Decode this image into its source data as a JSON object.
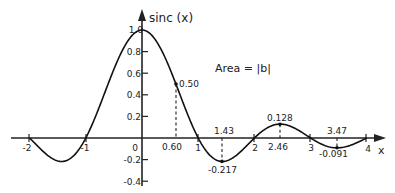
{
  "chart_data": {
    "type": "line",
    "title": "",
    "xlabel": "x",
    "ylabel": "sinc (x)",
    "xlim": [
      -2,
      4
    ],
    "ylim": [
      -0.4,
      1.0
    ],
    "grid": false,
    "legend": null,
    "function": "sinc(x) = sin(pi x)/(pi x)",
    "x_ticks": [
      -2,
      -1,
      0,
      1,
      2,
      3,
      4
    ],
    "x_tick_labels": [
      "-2",
      "-1",
      "0",
      "1",
      "2",
      "3",
      "4"
    ],
    "y_ticks": [
      -0.4,
      -0.2,
      0.2,
      0.4,
      0.6,
      0.8,
      1.0
    ],
    "y_tick_labels": [
      "-0.4",
      "-0.2",
      "0.2",
      "0.4",
      "0.6",
      "0.8",
      "1.0"
    ],
    "series": [
      {
        "name": "sinc(x)",
        "x": [
          -2,
          -1.5,
          -1.43,
          -1,
          -0.5,
          0,
          0.5,
          0.6,
          1,
          1.43,
          1.5,
          2,
          2.46,
          2.5,
          3,
          3.47,
          3.5,
          4
        ],
        "values": [
          0,
          -0.212,
          -0.217,
          0,
          0.637,
          1.0,
          0.637,
          0.5,
          0,
          -0.217,
          -0.212,
          0,
          0.128,
          0.127,
          0,
          -0.091,
          -0.091,
          0
        ]
      }
    ],
    "annotations": [
      {
        "x": 0.6,
        "y": 0.5,
        "label": "0.50",
        "x_label": "0.60",
        "dashed": true
      },
      {
        "x": 1.43,
        "y": -0.217,
        "label": "-0.217",
        "x_label": "1.43",
        "dashed": true
      },
      {
        "x": 2.46,
        "y": 0.128,
        "label": "0.128",
        "x_label": "2.46",
        "dashed": true
      },
      {
        "x": 3.47,
        "y": -0.091,
        "label": "-0.091",
        "x_label": "3.47",
        "dashed": true
      }
    ],
    "text_annotations": [
      "Area = |b|"
    ]
  },
  "labels": {
    "y_axis": "sinc (x)",
    "x_axis": "x",
    "area": "Area = |b|",
    "origin": "0",
    "ticks_x": [
      "-2",
      "-1",
      "1",
      "2",
      "3",
      "4"
    ],
    "ticks_y": [
      "1.0",
      "0.8",
      "0.6",
      "0.4",
      "0.2",
      "-0.2",
      "-0.4"
    ],
    "ann": {
      "p1_val": "0.50",
      "p1_x": "0.60",
      "p2_val": "-0.217",
      "p2_x": "1.43",
      "p3_val": "0.128",
      "p3_x": "2.46",
      "p4_val": "-0.091",
      "p4_x": "3.47"
    }
  }
}
